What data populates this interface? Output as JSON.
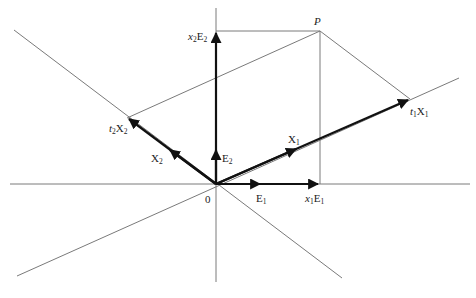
{
  "diagram": {
    "type": "vector-decomposition",
    "origin_label": "0",
    "point_label": "P",
    "labels": {
      "E1": {
        "base": "E",
        "sub": "1"
      },
      "E2": {
        "base": "E",
        "sub": "2"
      },
      "X1": {
        "base": "X",
        "sub": "1"
      },
      "X2": {
        "base": "X",
        "sub": "2"
      },
      "x1E1": {
        "coef": "x",
        "coef_sub": "1",
        "base": "E",
        "sub": "1"
      },
      "x2E2": {
        "coef": "x",
        "coef_sub": "2",
        "base": "E",
        "sub": "2"
      },
      "t1X1": {
        "coef": "t",
        "coef_sub": "1",
        "base": "X",
        "sub": "1"
      },
      "t2X2": {
        "coef": "t",
        "coef_sub": "2",
        "base": "X",
        "sub": "2"
      }
    },
    "colors": {
      "vector": "#111111",
      "guide_line": "#7a7a7a",
      "text": "#222222"
    }
  }
}
